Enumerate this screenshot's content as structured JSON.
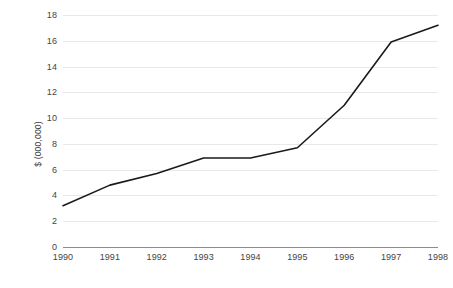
{
  "chart_data": {
    "type": "line",
    "title": "",
    "subtitle": "",
    "xlabel": "",
    "ylabel": "$ (000,000)",
    "categories": [
      "1990",
      "1991",
      "1992",
      "1993",
      "1994",
      "1995",
      "1996",
      "1997",
      "1998"
    ],
    "x": [
      1990,
      1991,
      1992,
      1993,
      1994,
      1995,
      1996,
      1997,
      1998
    ],
    "values": [
      3.2,
      4.8,
      5.7,
      6.9,
      6.9,
      7.7,
      11.0,
      15.9,
      17.2
    ],
    "series": [
      {
        "name": "",
        "values": [
          3.2,
          4.8,
          5.7,
          6.9,
          6.9,
          7.7,
          11.0,
          15.9,
          17.2
        ],
        "color": "#1a1a1a",
        "line_width": 1.6,
        "markers": false
      }
    ],
    "ylim": [
      0,
      18
    ],
    "xlim": [
      1990,
      1998
    ],
    "y_ticks": [
      0,
      2,
      4,
      6,
      8,
      10,
      12,
      14,
      16,
      18
    ],
    "y_tick_labels": [
      "0",
      "2",
      "4",
      "6",
      "8",
      "10",
      "12",
      "14",
      "16",
      "18"
    ],
    "x_tick_labels": [
      "1990",
      "1991",
      "1992",
      "1993",
      "1994",
      "1995",
      "1996",
      "1997",
      "1998"
    ],
    "grid": {
      "horizontal": true,
      "vertical": false,
      "color": "#e8e8e8"
    },
    "axis": {
      "baseline_color": "#8d8d8d",
      "left_spine": false,
      "right_spine": false,
      "top_spine": false,
      "bottom_spine": true
    },
    "legend": {
      "visible": false,
      "position": "none",
      "entries": []
    },
    "background_color": "#ffffff",
    "text_color": "#444444"
  }
}
